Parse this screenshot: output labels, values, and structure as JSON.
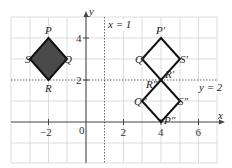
{
  "diagram": {
    "axes": {
      "x_label": "x",
      "y_label": "y",
      "origin_label": "0",
      "x_ticks": [
        {
          "value": -2,
          "label": "−2"
        },
        {
          "value": 2,
          "label": "2"
        },
        {
          "value": 4,
          "label": "4"
        },
        {
          "value": 6,
          "label": "6"
        }
      ],
      "y_ticks": [
        {
          "value": 2,
          "label": "2"
        },
        {
          "value": 4,
          "label": "4"
        }
      ],
      "x_range": [
        -4,
        7
      ],
      "y_range": [
        -2,
        5
      ]
    },
    "mirror_lines": [
      {
        "name": "x-equals-1",
        "label": "x = 1",
        "orientation": "vertical",
        "value": 1
      },
      {
        "name": "y-equals-2",
        "label": "y = 2",
        "orientation": "horizontal",
        "value": 2
      }
    ],
    "shapes": [
      {
        "name": "PQRS",
        "filled": true,
        "fill": "#4a4a4a",
        "vertices": [
          {
            "label": "P",
            "x": -2,
            "y": 4
          },
          {
            "label": "Q",
            "x": -1,
            "y": 3
          },
          {
            "label": "R",
            "x": -2,
            "y": 2
          },
          {
            "label": "S",
            "x": -3,
            "y": 3
          }
        ]
      },
      {
        "name": "P'Q'R'S'",
        "filled": false,
        "vertices": [
          {
            "label": "P′",
            "x": 4,
            "y": 4
          },
          {
            "label": "S′",
            "x": 5,
            "y": 3
          },
          {
            "label": "R′",
            "x": 4,
            "y": 2
          },
          {
            "label": "Q′",
            "x": 3,
            "y": 3
          }
        ]
      },
      {
        "name": "P''Q''R''S''",
        "filled": false,
        "vertices": [
          {
            "label": "R″",
            "x": 4,
            "y": 2
          },
          {
            "label": "S″",
            "x": 5,
            "y": 1
          },
          {
            "label": "P″",
            "x": 4,
            "y": 0
          },
          {
            "label": "Q″",
            "x": 3,
            "y": 1
          }
        ]
      }
    ],
    "labels": {
      "P": "P",
      "Q": "Q",
      "R": "R",
      "S": "S",
      "P1": "P′",
      "Q1": "Q′",
      "R1": "R′",
      "S1": "S′",
      "P2": "P″",
      "Q2": "Q″",
      "R2": "R″",
      "S2": "S″"
    },
    "colors": {
      "grid": "#d4d4d4",
      "axis": "#444444",
      "shape_stroke": "#111111",
      "shape_fill": "#4a4a4a",
      "mirror_line": "#555555"
    }
  }
}
